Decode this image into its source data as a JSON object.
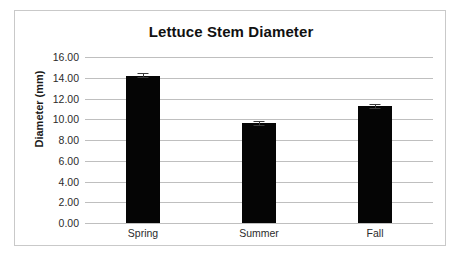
{
  "chart_data": {
    "type": "bar",
    "title": "Lettuce Stem Diameter",
    "xlabel": "",
    "ylabel": "Diameter (mm)",
    "categories": [
      "Spring",
      "Summer",
      "Fall"
    ],
    "values": [
      14.2,
      9.6,
      11.25
    ],
    "errors": [
      0.25,
      0.25,
      0.25
    ],
    "ylim": [
      0.0,
      16.0
    ],
    "ytick_step": 2.0,
    "ytick_labels": [
      "16.00",
      "14.00",
      "12.00",
      "10.00",
      "8.00",
      "6.00",
      "4.00",
      "2.00",
      "0.00"
    ],
    "ytick_values": [
      16,
      14,
      12,
      10,
      8,
      6,
      4,
      2,
      0
    ],
    "grid": true,
    "legend": false,
    "legend_position": "none",
    "bar_color": "#050505",
    "gridline_color": "#bfbfbf",
    "border_color": "#c9c9c9",
    "background_color": "#ffffff",
    "error_bar_color": "#3a3a3a"
  }
}
